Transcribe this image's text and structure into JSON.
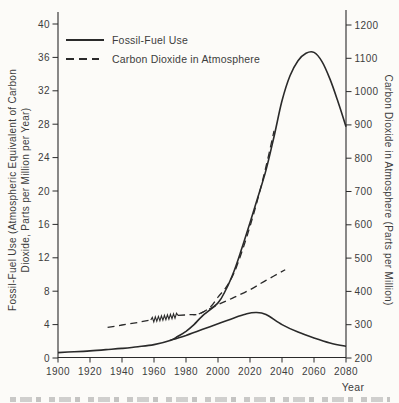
{
  "figure": {
    "legend": {
      "items": [
        {
          "label": "Fossil-Fuel Use",
          "line_style": "solid"
        },
        {
          "label": "Carbon Dioxide in Atmosphere",
          "line_style": "dashed"
        }
      ]
    },
    "left_axis": {
      "label_line1": "Fossil-Fuel Use (Atmospheric Equivalent of Carbon",
      "label_line2": "Dioxide, Parts per Million per Year)"
    },
    "right_axis": {
      "label": "Carbon Dioxide in Atmosphere (Parts per Million)"
    },
    "x_axis": {
      "label": "Year"
    }
  },
  "chart_data": {
    "type": "line",
    "title": "",
    "xlabel": "Year",
    "x_range": [
      1900,
      2080
    ],
    "x_ticks": [
      1900,
      1920,
      1940,
      1960,
      1980,
      2000,
      2020,
      2040,
      2060,
      2080
    ],
    "left_y": {
      "label": "Fossil-Fuel Use (Atmospheric Equivalent of Carbon Dioxide, Parts per Million per Year)",
      "range": [
        0,
        40
      ],
      "ticks": [
        0,
        4,
        8,
        12,
        16,
        20,
        24,
        28,
        32,
        36,
        40
      ]
    },
    "right_y": {
      "label": "Carbon Dioxide in Atmosphere (Parts per Million)",
      "range": [
        200,
        1200
      ],
      "ticks": [
        200,
        300,
        400,
        500,
        600,
        700,
        800,
        900,
        1000,
        1100,
        1200
      ]
    },
    "grid": false,
    "legend_position": "top-left",
    "series": [
      {
        "name": "fossil-fuel-use-high-growth",
        "legend": "Fossil-Fuel Use",
        "axis": "left",
        "line": "solid",
        "points": [
          [
            1900,
            0.65
          ],
          [
            1910,
            0.75
          ],
          [
            1920,
            0.85
          ],
          [
            1930,
            1.0
          ],
          [
            1940,
            1.15
          ],
          [
            1950,
            1.35
          ],
          [
            1960,
            1.6
          ],
          [
            1970,
            2.1
          ],
          [
            1975,
            2.6
          ],
          [
            1980,
            3.2
          ],
          [
            1985,
            4.0
          ],
          [
            1990,
            5.0
          ],
          [
            2000,
            6.6
          ],
          [
            2005,
            8.2
          ],
          [
            2010,
            10.4
          ],
          [
            2015,
            13.2
          ],
          [
            2020,
            16.2
          ],
          [
            2025,
            19.3
          ],
          [
            2030,
            22.5
          ],
          [
            2035,
            26.5
          ],
          [
            2040,
            30.8
          ],
          [
            2045,
            33.8
          ],
          [
            2050,
            35.6
          ],
          [
            2055,
            36.5
          ],
          [
            2060,
            36.6
          ],
          [
            2065,
            35.5
          ],
          [
            2070,
            33.4
          ],
          [
            2075,
            30.7
          ],
          [
            2080,
            27.7
          ]
        ]
      },
      {
        "name": "fossil-fuel-use-reduced-growth",
        "legend": "Fossil-Fuel Use",
        "axis": "left",
        "line": "solid",
        "points": [
          [
            1970,
            2.1
          ],
          [
            1975,
            2.4
          ],
          [
            1980,
            2.7
          ],
          [
            1990,
            3.4
          ],
          [
            2000,
            4.1
          ],
          [
            2010,
            4.8
          ],
          [
            2018,
            5.3
          ],
          [
            2024,
            5.45
          ],
          [
            2030,
            5.2
          ],
          [
            2040,
            4.0
          ],
          [
            2050,
            3.1
          ],
          [
            2060,
            2.4
          ],
          [
            2070,
            1.8
          ],
          [
            2080,
            1.4
          ]
        ]
      },
      {
        "name": "co2-atmosphere-observed",
        "legend": "Carbon Dioxide in Atmosphere",
        "axis": "right",
        "line": "dashed",
        "points": [
          [
            1931,
            292
          ],
          [
            1940,
            299
          ],
          [
            1950,
            307
          ],
          [
            1958,
            314
          ]
        ]
      },
      {
        "name": "co2-atmosphere-observed-oscillation",
        "legend": "Carbon Dioxide in Atmosphere",
        "axis": "right",
        "line": "zigzag",
        "cycles": 9,
        "amplitude_ppm": 7,
        "points": [
          [
            1958,
            314
          ],
          [
            1975,
            328
          ]
        ]
      },
      {
        "name": "co2-atmosphere-high-growth",
        "legend": "Carbon Dioxide in Atmosphere",
        "axis": "right",
        "line": "dashed",
        "points": [
          [
            1975,
            328
          ],
          [
            1982,
            330
          ],
          [
            1988,
            332
          ],
          [
            1995,
            352
          ],
          [
            2000,
            383
          ],
          [
            2005,
            412
          ],
          [
            2010,
            455
          ],
          [
            2015,
            520
          ],
          [
            2020,
            595
          ],
          [
            2025,
            680
          ],
          [
            2030,
            775
          ],
          [
            2035,
            882
          ]
        ]
      },
      {
        "name": "co2-atmosphere-reduced-growth",
        "legend": "Carbon Dioxide in Atmosphere",
        "axis": "right",
        "line": "dashed",
        "points": [
          [
            1988,
            332
          ],
          [
            2000,
            360
          ],
          [
            2010,
            382
          ],
          [
            2020,
            405
          ],
          [
            2030,
            433
          ],
          [
            2042,
            465
          ]
        ]
      }
    ]
  },
  "colors": {
    "line": "#2a2a2a",
    "text": "#3d3d3d",
    "background": "#fcfbf8"
  }
}
